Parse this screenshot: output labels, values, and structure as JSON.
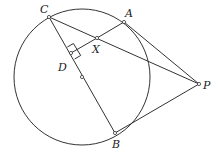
{
  "figure": {
    "type": "geometry-diagram",
    "stroke_color": "#333333",
    "background": "#ffffff",
    "circle": {
      "cx": 82,
      "cy": 77,
      "r": 68
    },
    "points": {
      "C": {
        "x": 49,
        "y": 17,
        "label": "C",
        "lx": 40,
        "ly": 13
      },
      "A": {
        "x": 124,
        "y": 22,
        "label": "A",
        "lx": 125,
        "ly": 17
      },
      "X": {
        "x": 97,
        "y": 38,
        "label": "X",
        "lx": 92,
        "ly": 53
      },
      "D": {
        "x": 71,
        "y": 53,
        "label": "D",
        "lx": 58,
        "ly": 71
      },
      "O": {
        "x": 82,
        "y": 77,
        "label": ""
      },
      "P": {
        "x": 199,
        "y": 84,
        "label": "P",
        "lx": 203,
        "ly": 89
      },
      "B": {
        "x": 115,
        "y": 133,
        "label": "B",
        "lx": 112,
        "ly": 148
      }
    },
    "segments": [
      [
        "C",
        "B"
      ],
      [
        "C",
        "P"
      ],
      [
        "A",
        "P"
      ],
      [
        "B",
        "P"
      ],
      [
        "A",
        "X"
      ],
      [
        "X",
        "D"
      ]
    ],
    "right_angle_at": "D"
  }
}
